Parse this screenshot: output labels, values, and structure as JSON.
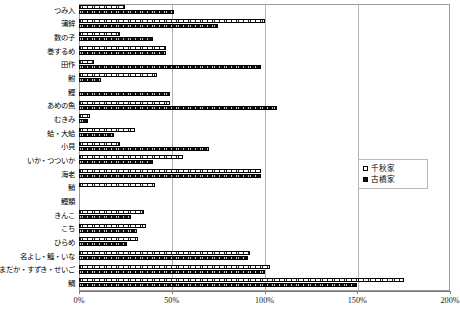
{
  "chart_data": {
    "type": "bar",
    "orientation": "horizontal",
    "title": "",
    "xlabel": "",
    "ylabel": "",
    "xlim": [
      0,
      200
    ],
    "xunit": "%",
    "xticks": [
      "0%",
      "50%",
      "100%",
      "150%",
      "200%"
    ],
    "xtick_values": [
      0,
      50,
      100,
      150,
      200
    ],
    "grid": true,
    "grid_axis": "x",
    "legend_position": "right-middle",
    "categories": [
      "つみ入",
      "蒲鉾",
      "数の子",
      "巻するめ",
      "田作",
      "鮒",
      "鰹",
      "あめの魚",
      "むきみ",
      "蛤・大蛤",
      "小貝",
      "いか・つついか",
      "海老",
      "鮹",
      "鰹類",
      "きんこ",
      "こち",
      "ひらめ",
      "名よし・鯔・いな",
      "まだか・すずき・せいご",
      "鯛"
    ],
    "series": [
      {
        "name": "千秋家",
        "fill": "open",
        "values": [
          25,
          100,
          22,
          47,
          8,
          42,
          0,
          49,
          6,
          30,
          22,
          56,
          98,
          41,
          0,
          35,
          36,
          32,
          92,
          103,
          175
        ]
      },
      {
        "name": "古橋家",
        "fill": "solid",
        "values": [
          51,
          75,
          40,
          47,
          98,
          12,
          49,
          107,
          5,
          19,
          70,
          40,
          98,
          0,
          0,
          28,
          31,
          26,
          91,
          100,
          150
        ]
      }
    ]
  },
  "legend": {
    "items": [
      {
        "label": "千秋家",
        "swatch": "open-square"
      },
      {
        "label": "古橋家",
        "swatch": "filled-square"
      }
    ]
  },
  "axis": {
    "x_ticks": [
      "0%",
      "50%",
      "100%",
      "150%",
      "200%"
    ]
  }
}
